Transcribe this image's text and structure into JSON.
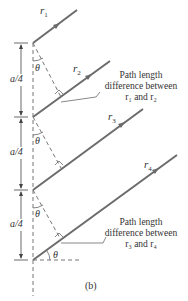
{
  "figure": {
    "caption": "(b)",
    "rays": [
      {
        "id": "r1",
        "label": "r",
        "sub": "1"
      },
      {
        "id": "r2",
        "label": "r",
        "sub": "2"
      },
      {
        "id": "r3",
        "label": "r",
        "sub": "3"
      },
      {
        "id": "r4",
        "label": "r",
        "sub": "4"
      }
    ],
    "spacing_label": "a/4",
    "angle_label": "θ",
    "annotations": [
      {
        "lines": [
          "Path length",
          "difference between",
          "r₁ and r₂"
        ]
      },
      {
        "lines": [
          "Path length",
          "difference between",
          "r₃ and r₄"
        ]
      }
    ],
    "colors": {
      "ray": "#6b6b6b",
      "dash": "#777777",
      "text": "#333333"
    }
  }
}
